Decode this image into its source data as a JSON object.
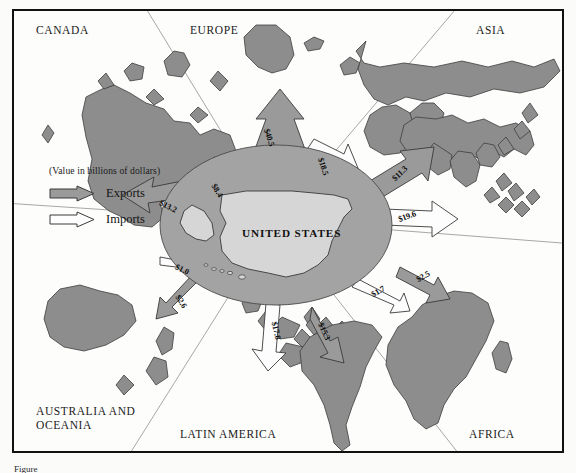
{
  "figure": {
    "caption_fragment": "Figure",
    "colors": {
      "landmass_fill": "#8d8d8d",
      "export_arrow_fill": "#9a9a9a",
      "import_arrow_fill": "#fdfdfd",
      "hub_fill": "#a3a3a3",
      "us_fill": "#d6d6d6",
      "frame_stroke": "#111111",
      "divider_stroke": "#9d9d9d"
    }
  },
  "legend": {
    "title": "(Value in billions of dollars)",
    "items": [
      {
        "label": "Exports",
        "style": "filled-grey-arrow"
      },
      {
        "label": "Imports",
        "style": "outlined-white-arrow"
      }
    ]
  },
  "hub": {
    "label": "UNITED STATES"
  },
  "regions": [
    {
      "id": "canada",
      "label": "CANADA",
      "x": 22,
      "y": 13
    },
    {
      "id": "europe",
      "label": "EUROPE",
      "x": 176,
      "y": 13
    },
    {
      "id": "asia",
      "label": "ASIA",
      "x": 462,
      "y": 13
    },
    {
      "id": "australia",
      "label": "AUSTRALIA AND\nOCEANIA",
      "x": 22,
      "y": 406
    },
    {
      "id": "latin",
      "label": "LATIN AMERICA",
      "x": 166,
      "y": 429
    },
    {
      "id": "africa",
      "label": "AFRICA",
      "x": 455,
      "y": 429
    }
  ],
  "chart_data": {
    "type": "flow-map",
    "units": "billions of dollars",
    "legend": [
      "Exports",
      "Imports"
    ],
    "hub": "UNITED STATES",
    "flows": [
      {
        "partner": "EUROPE",
        "direction": "export",
        "label": "$40.5",
        "value": 40.5,
        "x": 258,
        "y": 127,
        "rot": 72
      },
      {
        "partner": "EUROPE",
        "direction": "import",
        "label": "$18.5",
        "value": 18.5,
        "x": 312,
        "y": 156,
        "rot": 72
      },
      {
        "partner": "ASIA",
        "direction": "export",
        "label": "$11.3",
        "value": 11.3,
        "x": 389,
        "y": 163,
        "rot": -44
      },
      {
        "partner": "ASIA",
        "direction": "import",
        "label": "$19.6",
        "value": 19.6,
        "x": 396,
        "y": 206,
        "rot": -20
      },
      {
        "partner": "AFRICA",
        "direction": "export",
        "label": "$2.5",
        "value": 2.5,
        "x": 414,
        "y": 266,
        "rot": -30
      },
      {
        "partner": "AFRICA",
        "direction": "import",
        "label": "$1.7",
        "value": 1.7,
        "x": 369,
        "y": 281,
        "rot": -30
      },
      {
        "partner": "LATIN AMERICA",
        "direction": "export",
        "label": "$15.3",
        "value": 15.3,
        "x": 313,
        "y": 321,
        "rot": 65
      },
      {
        "partner": "LATIN AMERICA",
        "direction": "import",
        "label": "$17.8",
        "value": 17.8,
        "x": 265,
        "y": 320,
        "rot": 78
      },
      {
        "partner": "AUSTRALIA AND OCEANIA",
        "direction": "export",
        "label": "$2.6",
        "value": 2.6,
        "x": 172,
        "y": 291,
        "rot": 60
      },
      {
        "partner": "AUSTRALIA AND OCEANIA",
        "direction": "import",
        "label": "$1.0",
        "value": 1.0,
        "x": 173,
        "y": 259,
        "rot": 26
      },
      {
        "partner": "CANADA",
        "direction": "export",
        "label": "$13.2",
        "value": 13.2,
        "x": 157,
        "y": 196,
        "rot": 26
      },
      {
        "partner": "CANADA",
        "direction": "import",
        "label": "$8.4",
        "value": 8.4,
        "x": 208,
        "y": 180,
        "rot": 58
      }
    ]
  }
}
